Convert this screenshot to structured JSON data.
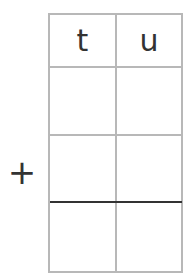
{
  "worksheet": {
    "type": "column-addition-grid",
    "columns": [
      {
        "header": "t"
      },
      {
        "header": "u"
      }
    ],
    "rows": [
      {
        "operator": "",
        "cells": [
          "",
          ""
        ]
      },
      {
        "operator": "+",
        "cells": [
          "",
          ""
        ]
      },
      {
        "operator": "",
        "cells": [
          "",
          ""
        ]
      }
    ],
    "answer_line_after_row": 2,
    "colors": {
      "grid": "#b8b8b8",
      "answer_line": "#333333",
      "text": "#333333"
    }
  }
}
